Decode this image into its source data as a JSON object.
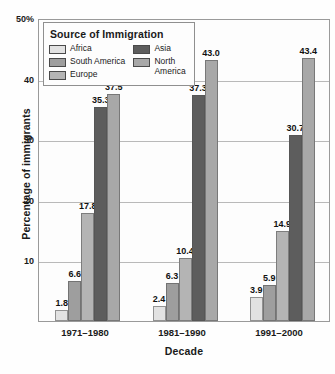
{
  "chart_data": {
    "type": "bar",
    "title": "",
    "xlabel": "Decade",
    "ylabel": "Percentage of immigrants",
    "ylim": [
      0,
      50
    ],
    "yticks": [
      "50%",
      "40",
      "30",
      "20",
      "10"
    ],
    "ytick_values": [
      50,
      40,
      30,
      20,
      10
    ],
    "grid": true,
    "legend_position": "top-left inside plot",
    "legend_title": "Source of Immigration",
    "categories": [
      "1971–1980",
      "1981–1990",
      "1991–2000"
    ],
    "series": [
      {
        "name": "Africa",
        "color": "#e2e2e2",
        "values": [
          1.8,
          2.4,
          3.9
        ],
        "labels": [
          "1.8",
          "2.4",
          "3.9"
        ]
      },
      {
        "name": "South America",
        "color": "#9e9e9e",
        "values": [
          6.6,
          6.3,
          5.9
        ],
        "labels": [
          "6.6",
          "6.3",
          "5.9"
        ]
      },
      {
        "name": "Europe",
        "color": "#b4b4b4",
        "values": [
          17.8,
          10.4,
          14.9
        ],
        "labels": [
          "17.8",
          "10.4",
          "14.9"
        ]
      },
      {
        "name": "Asia",
        "color": "#5d5d5d",
        "values": [
          35.3,
          37.3,
          30.7
        ],
        "labels": [
          "35.3",
          "37.3",
          "30.7"
        ]
      },
      {
        "name": "North America",
        "color": "#a8a8a8",
        "values": [
          37.5,
          43.0,
          43.4
        ],
        "labels": [
          "37.5",
          "43.0",
          "43.4"
        ]
      }
    ]
  },
  "legend": {
    "title": "Source of Immigration",
    "column_left": [
      {
        "label": "Africa",
        "color": "#e2e2e2"
      },
      {
        "label": "South America",
        "color": "#9e9e9e"
      },
      {
        "label": "Europe",
        "color": "#b4b4b4"
      }
    ],
    "column_right": [
      {
        "label": "Asia",
        "color": "#5d5d5d"
      },
      {
        "label": "North America",
        "color": "#a8a8a8"
      }
    ]
  },
  "axes": {
    "y_title": "Percentage of immigrants",
    "x_title": "Decade",
    "y_labels": [
      "50%",
      "40",
      "30",
      "20",
      "10"
    ],
    "x_labels": [
      "1971–1980",
      "1981–1990",
      "1991–2000"
    ]
  },
  "colors": {
    "frame": "#9a9a9a",
    "grid": "#b9b9b9",
    "text": "#1a1a1a",
    "plot_background": "#fdfdfd"
  }
}
